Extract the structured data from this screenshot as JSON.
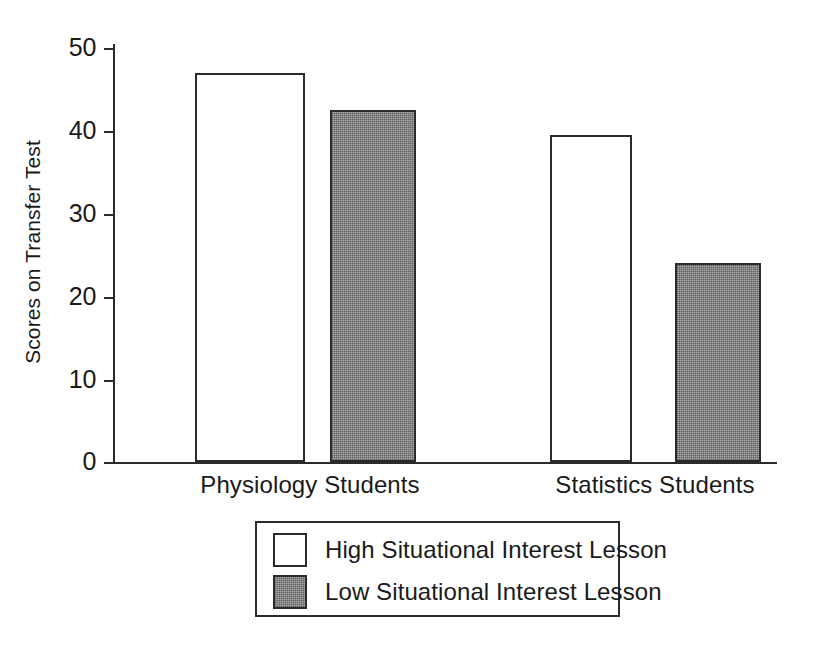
{
  "chart_data": {
    "type": "bar",
    "title": "",
    "subtitle": "",
    "xlabel": "",
    "ylabel": "Scores on Transfer Test",
    "categories": [
      "Physiology Students",
      "Statistics Students"
    ],
    "series": [
      {
        "name": "High Situational Interest Lesson",
        "values": [
          47,
          39.5
        ],
        "fill": "#ffffff",
        "stroke": "#2b2b2b",
        "swatch": "white-outline-swatch"
      },
      {
        "name": "Low Situational Interest Lesson",
        "values": [
          42.5,
          24
        ],
        "fill": "#8a8a8a",
        "stroke": "#2b2b2b",
        "swatch": "gray-filled-swatch"
      }
    ],
    "ylim": [
      0,
      50
    ],
    "yticks": [
      0,
      10,
      20,
      30,
      40,
      50
    ],
    "ytick_labels": [
      "0",
      "10",
      "20",
      "30",
      "40",
      "50"
    ],
    "grid": false,
    "legend_position": "below-plot-center",
    "annotations": []
  },
  "axes": {
    "y_title": "Scores on Transfer Test",
    "ticks": [
      {
        "value": 50,
        "label": "50"
      },
      {
        "value": 40,
        "label": "40"
      },
      {
        "value": 30,
        "label": "30"
      },
      {
        "value": 20,
        "label": "20"
      },
      {
        "value": 10,
        "label": "10"
      },
      {
        "value": 0,
        "label": "0"
      }
    ]
  },
  "categories": [
    {
      "label": "Physiology Students"
    },
    {
      "label": "Statistics Students"
    }
  ],
  "legend": {
    "entries": [
      {
        "label": "High Situational Interest Lesson"
      },
      {
        "label": "Low Situational Interest Lesson"
      }
    ]
  },
  "colors": {
    "ink": "#2b2b2b",
    "text": "#1a1a1a",
    "background": "#ffffff",
    "series_low_fill": "#8a8a8a",
    "series_high_fill": "#ffffff"
  }
}
